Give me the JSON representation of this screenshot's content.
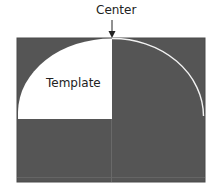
{
  "diagram": {
    "center_label": "Center",
    "template_label": "Template",
    "colors": {
      "background_panel": "#555555",
      "template_fill": "#ffffff",
      "arc_stroke": "#f2f2f2",
      "guide_line": "#6e6e6e",
      "arrow": "#222222"
    }
  }
}
